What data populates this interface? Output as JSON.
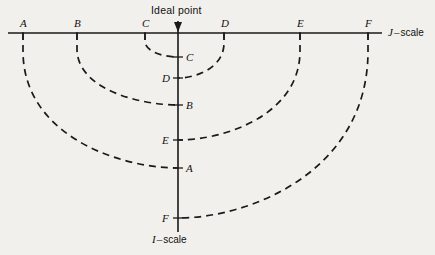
{
  "figure": {
    "background_color": "#f2f0ec",
    "ink_color": "#1a1a1a",
    "ideal_point_label": "Ideal point",
    "j_scale": {
      "symbol": "J",
      "dash": "–",
      "word": "scale"
    },
    "i_scale": {
      "symbol": "I",
      "dash": "–",
      "word": "scale"
    }
  },
  "chart_data": {
    "type": "line",
    "title": "Ideal point",
    "xlabel": "J – scale",
    "ylabel": "I – scale",
    "grid": false,
    "legend": null,
    "axes": {
      "j_axis": {
        "orientation": "horizontal",
        "x_start_px": 8,
        "x_end_px": 382,
        "y_px": 33,
        "label": "J – scale"
      },
      "i_axis": {
        "orientation": "vertical",
        "x_px": 178,
        "y_start_px": 21,
        "y_end_px": 232,
        "label": "I – scale"
      },
      "ideal_point": {
        "x_px": 178,
        "y_px": 33,
        "label": "Ideal point",
        "arrow": true
      }
    },
    "j_scale_points": [
      {
        "label": "A",
        "x_px": 23
      },
      {
        "label": "B",
        "x_px": 77
      },
      {
        "label": "C",
        "x_px": 145
      },
      {
        "label": "D",
        "x_px": 224
      },
      {
        "label": "E",
        "x_px": 300
      },
      {
        "label": "F",
        "x_px": 368
      }
    ],
    "i_scale_points": [
      {
        "label": "C",
        "y_px": 57,
        "label_side": "right"
      },
      {
        "label": "D",
        "y_px": 78,
        "label_side": "left"
      },
      {
        "label": "B",
        "y_px": 105,
        "label_side": "right"
      },
      {
        "label": "E",
        "y_px": 140,
        "label_side": "left"
      },
      {
        "label": "A",
        "y_px": 168,
        "label_side": "right"
      },
      {
        "label": "F",
        "y_px": 218,
        "label_side": "left"
      }
    ],
    "fold_curves": [
      {
        "label": "A",
        "side": "left",
        "from_x_px": 23,
        "to_y_px": 168
      },
      {
        "label": "B",
        "side": "left",
        "from_x_px": 77,
        "to_y_px": 105
      },
      {
        "label": "C",
        "side": "left",
        "from_x_px": 145,
        "to_y_px": 57
      },
      {
        "label": "D",
        "side": "right",
        "from_x_px": 224,
        "to_y_px": 78
      },
      {
        "label": "E",
        "side": "right",
        "from_x_px": 300,
        "to_y_px": 140
      },
      {
        "label": "F",
        "side": "right",
        "from_x_px": 368,
        "to_y_px": 218
      }
    ],
    "distances_from_ideal_px": {
      "A": 155,
      "B": 101,
      "C": 33,
      "D": 46,
      "E": 122,
      "F": 190
    },
    "rank_order_on_i_scale": [
      "C",
      "D",
      "B",
      "E",
      "A",
      "F"
    ]
  }
}
